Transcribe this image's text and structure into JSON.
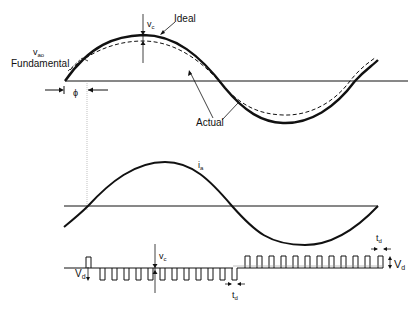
{
  "labels": {
    "ideal": "Ideal",
    "actual": "Actual",
    "vao": "v",
    "vao_sub": "ao",
    "fundamental": "Fundamental",
    "phi": "ϕ",
    "vc_top": "v",
    "vc_top_sub": "c",
    "ia": "i",
    "ia_sub": "a",
    "vc_bottom": "v",
    "vc_bottom_sub": "c",
    "vd_left": "V",
    "vd_left_sub": "d",
    "vd_right": "V",
    "vd_right_sub": "d",
    "td_bottom": "t",
    "td_bottom_sub": "d",
    "td_right": "t",
    "td_right_sub": "d"
  },
  "colors": {
    "stroke": "#111111",
    "gray_line": "#999999"
  }
}
